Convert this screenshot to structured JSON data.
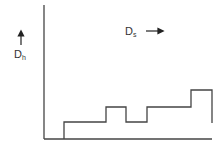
{
  "diagram": {
    "type": "step-profile",
    "labels": {
      "vertical_axis": {
        "main": "D",
        "sub": "h",
        "arrow": "up"
      },
      "horizontal_axis": {
        "main": "D",
        "sub": "s",
        "arrow": "right"
      }
    },
    "colors": {
      "stroke": "#444444",
      "text": "#333333",
      "background": "#ffffff"
    },
    "axes": {
      "origin": [
        44,
        139
      ],
      "y_top": 5,
      "x_end": 212
    },
    "profile_points": [
      [
        64,
        139
      ],
      [
        64,
        122
      ],
      [
        106,
        122
      ],
      [
        106,
        107
      ],
      [
        126,
        107
      ],
      [
        126,
        122
      ],
      [
        147,
        122
      ],
      [
        147,
        107
      ],
      [
        191,
        107
      ],
      [
        191,
        90
      ],
      [
        212,
        90
      ],
      [
        212,
        123
      ]
    ]
  }
}
